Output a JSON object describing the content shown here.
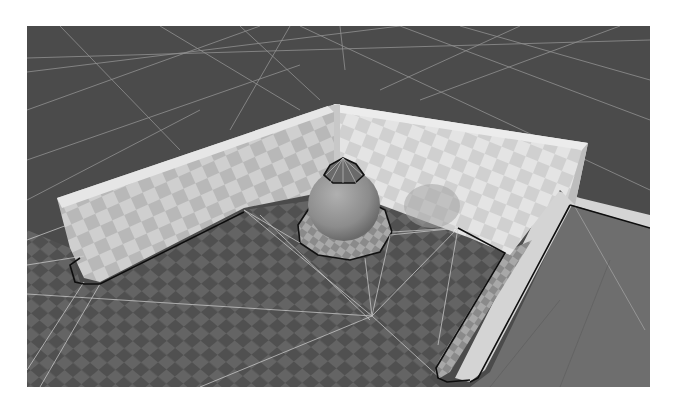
{
  "scene": {
    "description": "Grayscale 3D render of a navigation mesh: checkered floor with two L-shaped walls, a sphere obstacle and a raised floor slab",
    "objects": [
      "checkered-floor",
      "left-wall",
      "back-wall",
      "sphere-obstacle",
      "raised-slab",
      "navmesh-outline",
      "navmesh-triangulation"
    ],
    "colors": {
      "background": "#ffffff",
      "far-floor": "#4a4a4a",
      "floor-dark": "#505050",
      "floor-light": "#6a6a6a",
      "wall-light": "#d8d8d8",
      "wall-dark": "#b4b4b4",
      "sphere": "#9a9a9a",
      "slab": "#7a7a7a",
      "navmesh-edge": "#111111",
      "triangulation-line": "#c8c8c8"
    }
  }
}
